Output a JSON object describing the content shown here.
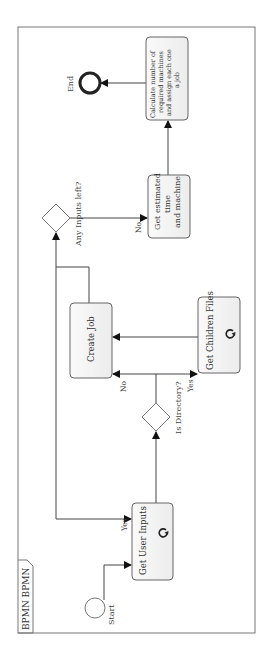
{
  "diagram": {
    "type": "BPMN process",
    "orientation": "rotated 90 degrees counter-clockwise",
    "pool": {
      "label": "BPMN BPMN"
    },
    "events": {
      "start": {
        "label": "Start"
      },
      "end": {
        "label": "End"
      }
    },
    "tasks": {
      "get_user_inputs": {
        "label": "Get User Inputs",
        "marker": "loop-icon"
      },
      "create_job": {
        "label": "Create Job"
      },
      "get_children_files": {
        "label": "Get Children Files",
        "marker": "loop-icon"
      },
      "get_estimated": {
        "lines": [
          "Get estimated",
          "time",
          "and machine"
        ]
      },
      "calculate": {
        "lines": [
          "Calculate number of",
          "required machines",
          "and assign each one",
          "a job"
        ]
      }
    },
    "gateways": {
      "is_directory": {
        "label": "Is Directory?"
      },
      "any_inputs_left": {
        "label": "Any Inputs left?"
      }
    },
    "flow_labels": {
      "yes_to_get_user_inputs": "Yes",
      "no_to_create_job": "No",
      "yes_to_get_children": "Yes",
      "no_to_get_estimated": "No"
    },
    "colors": {
      "stroke": "#555555",
      "task_fill": "#f4f4f4",
      "end_stroke": "#222222"
    }
  }
}
